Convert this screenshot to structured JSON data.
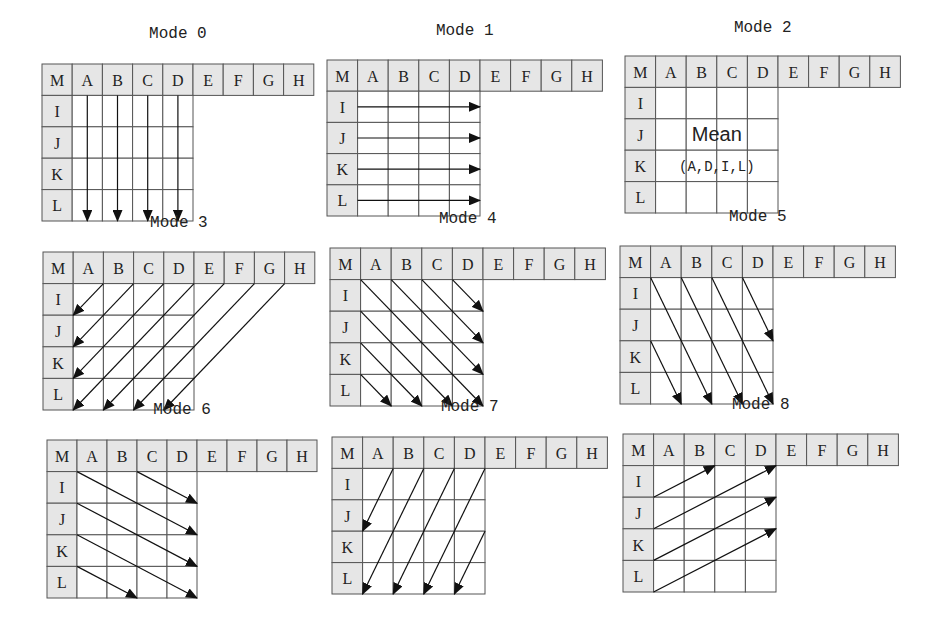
{
  "figure": {
    "header_labels": [
      "M",
      "A",
      "B",
      "C",
      "D",
      "E",
      "F",
      "G",
      "H"
    ],
    "row_labels": [
      "I",
      "J",
      "K",
      "L"
    ],
    "colors": {
      "header_fill": "#e6e6e6",
      "line": "#555555",
      "arrow": "#111111",
      "background": "#ffffff"
    },
    "modes": [
      {
        "title": "Mode 0",
        "x": 42,
        "y": 64,
        "cw": 30.2,
        "rh": 31.4,
        "titleY": 38,
        "arrows": [
          [
            1.5,
            1,
            1.5,
            5
          ],
          [
            2.5,
            1,
            2.5,
            5
          ],
          [
            3.5,
            1,
            3.5,
            5
          ],
          [
            4.5,
            1,
            4.5,
            5
          ]
        ]
      },
      {
        "title": "Mode 1",
        "x": 327,
        "y": 60,
        "cw": 30.6,
        "rh": 31.2,
        "titleY": 35,
        "arrows": [
          [
            1,
            1.5,
            5,
            1.5
          ],
          [
            1,
            2.5,
            5,
            2.5
          ],
          [
            1,
            3.5,
            5,
            3.5
          ],
          [
            1,
            4.5,
            5,
            4.5
          ]
        ]
      },
      {
        "title": "Mode 2",
        "x": 625,
        "y": 56,
        "cw": 30.6,
        "rh": 31.4,
        "titleY": 32,
        "arrows": [],
        "center_text": [
          "Mean",
          "(A,D,I,L)"
        ]
      },
      {
        "title": "Mode 3",
        "x": 43,
        "y": 252,
        "cw": 30.2,
        "rh": 31.6,
        "titleY": 227,
        "arrows": [
          [
            2,
            1,
            1,
            2
          ],
          [
            3,
            1,
            1,
            3
          ],
          [
            4,
            1,
            1,
            4
          ],
          [
            5,
            1,
            1,
            5
          ],
          [
            6,
            1,
            2,
            5
          ],
          [
            7,
            1,
            3,
            5
          ],
          [
            8,
            1,
            4,
            5
          ]
        ]
      },
      {
        "title": "Mode 4",
        "x": 330,
        "y": 248,
        "cw": 30.6,
        "rh": 31.6,
        "titleY": 223,
        "arrows": [
          [
            4,
            1,
            5,
            2
          ],
          [
            3,
            1,
            5,
            3
          ],
          [
            2,
            1,
            5,
            4
          ],
          [
            1,
            1,
            5,
            5
          ],
          [
            1,
            2,
            4,
            5
          ],
          [
            1,
            3,
            3,
            5
          ],
          [
            1,
            4,
            2,
            5
          ]
        ]
      },
      {
        "title": "Mode 5",
        "x": 620,
        "y": 246,
        "cw": 30.6,
        "rh": 31.6,
        "titleY": 221,
        "arrows": [
          [
            4,
            1,
            5,
            3
          ],
          [
            3,
            1,
            5,
            5
          ],
          [
            2,
            1,
            4,
            5
          ],
          [
            1,
            1,
            3,
            5
          ],
          [
            1,
            3,
            2,
            5
          ]
        ]
      },
      {
        "title": "Mode 6",
        "x": 47,
        "y": 440,
        "cw": 30,
        "rh": 31.6,
        "titleY": 414,
        "arrows": [
          [
            3,
            1,
            5,
            2
          ],
          [
            1,
            1,
            5,
            3
          ],
          [
            1,
            2,
            5,
            4
          ],
          [
            1,
            3,
            5,
            5
          ],
          [
            1,
            4,
            3,
            5
          ]
        ]
      },
      {
        "title": "Mode 7",
        "x": 332,
        "y": 437,
        "cw": 30.6,
        "rh": 31.4,
        "titleY": 411,
        "arrows": [
          [
            2,
            1,
            1,
            3
          ],
          [
            3,
            1,
            1,
            5
          ],
          [
            4,
            1,
            2,
            5
          ],
          [
            5,
            1,
            3,
            5
          ],
          [
            5,
            3,
            4,
            5
          ]
        ]
      },
      {
        "title": "Mode 8",
        "x": 623,
        "y": 434,
        "cw": 30.6,
        "rh": 31.6,
        "titleY": 409,
        "arrows": [
          [
            1,
            2,
            3,
            1
          ],
          [
            1,
            3,
            5,
            1
          ],
          [
            1,
            4,
            5,
            2
          ],
          [
            1,
            5,
            5,
            3
          ]
        ]
      }
    ]
  }
}
